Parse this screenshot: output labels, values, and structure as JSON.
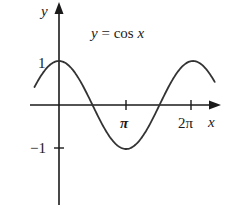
{
  "chart_data": {
    "type": "line",
    "title": "y = cos x",
    "title_parts": {
      "lhs": "y",
      "eq": " = cos ",
      "var": "x"
    },
    "xlabel": "x",
    "ylabel": "y",
    "x_ticks": [
      {
        "value": 3.14159,
        "label": "π"
      },
      {
        "value": 6.28318,
        "label": "2π"
      }
    ],
    "y_ticks": [
      {
        "value": 1,
        "label": "1"
      },
      {
        "value": -1,
        "label": "-1"
      }
    ],
    "y_tick_labels": {
      "one": "1",
      "minus_one": "−1"
    },
    "x_tick_labels": {
      "pi": "π",
      "two_pi": "2π"
    },
    "xlim": [
      -1.1,
      7.4
    ],
    "ylim": [
      -2.3,
      2.4
    ],
    "grid": false,
    "legend": null,
    "series": [
      {
        "name": "cos x",
        "function": "cos",
        "x_range": [
          -1.15,
          7.3
        ],
        "color": "#333333"
      }
    ]
  }
}
